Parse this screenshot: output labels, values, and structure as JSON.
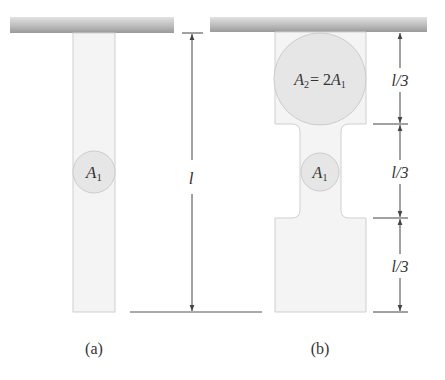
{
  "figure": {
    "panel_a": {
      "caption": "(a)",
      "cross_section": {
        "symbol": "A",
        "subscript": "1"
      },
      "length_label": "l"
    },
    "panel_b": {
      "caption": "(b)",
      "top_section": {
        "symbol": "A",
        "subscript": "2",
        "equals": "= 2",
        "ref_symbol": "A",
        "ref_subscript": "1"
      },
      "middle_section": {
        "symbol": "A",
        "subscript": "1"
      },
      "segment_labels": [
        "l/3",
        "l/3",
        "l/3"
      ]
    }
  },
  "colors": {
    "ceiling": "#b5b5b5",
    "bar_fill": "#f4f4f4",
    "bar_stroke": "#cfcfcf",
    "circle_fill": "#e6e6e6",
    "circle_stroke": "#cccccc",
    "dimension": "#444444"
  }
}
